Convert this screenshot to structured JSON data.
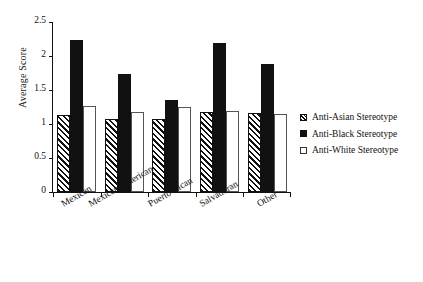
{
  "chart_data": {
    "type": "bar",
    "title": "",
    "xlabel": "",
    "ylabel": "Average Score",
    "ylim": [
      0,
      2.5
    ],
    "ytick_labels": [
      "0",
      "0.5",
      "1",
      "1.5",
      "2",
      "2.5"
    ],
    "ytick_values": [
      0,
      0.5,
      1,
      1.5,
      2,
      2.5
    ],
    "grid": false,
    "legend_position": "right",
    "categories": [
      "Mexican",
      "Mexican American",
      "Puerto Rican",
      "Salvadoran",
      "Other"
    ],
    "series": [
      {
        "name": "Anti-Asian Stereotype",
        "fill": "hatched",
        "values": [
          1.13,
          1.08,
          1.08,
          1.17,
          1.16
        ]
      },
      {
        "name": "Anti-Black Stereotype",
        "fill": "solid",
        "values": [
          2.24,
          1.74,
          1.36,
          2.19,
          1.88
        ]
      },
      {
        "name": "Anti-White Stereotype",
        "fill": "open",
        "values": [
          1.27,
          1.17,
          1.25,
          1.19,
          1.15
        ]
      }
    ]
  }
}
